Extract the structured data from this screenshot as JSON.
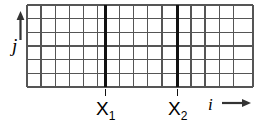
{
  "figure": {
    "type": "grid-diagram",
    "background": "#ffffff",
    "line_color": "#555555",
    "bold_line_color": "#111111",
    "grid": {
      "x": 27,
      "y": 5,
      "width": 226,
      "height": 82,
      "columns": 16,
      "rows": 6,
      "cell_width": 14.125,
      "cell_height": 13.667,
      "thin_line_width": 1.4,
      "bold_line_width": 2.6
    },
    "bold_lines": [
      {
        "name": "X1",
        "x": 105.5
      },
      {
        "name": "X2",
        "x": 177.5
      }
    ],
    "ticks": [
      {
        "name": "tick-x1",
        "x": 105.5,
        "y_top": 88,
        "y_bottom": 96
      },
      {
        "name": "tick-x2",
        "x": 177.5,
        "y_top": 88,
        "y_bottom": 96
      }
    ],
    "axes": {
      "j_axis": {
        "label": "j",
        "arrow": "up",
        "x": 20,
        "y_top": 14,
        "y_bottom": 38
      },
      "i_axis": {
        "label": "i",
        "arrow": "right",
        "y": 103,
        "x_start": 222,
        "x_end": 250
      }
    },
    "labels": {
      "x1_base": "X",
      "x1_sub": "1",
      "x2_base": "X",
      "x2_sub": "2",
      "j": "j",
      "i": "i"
    }
  }
}
